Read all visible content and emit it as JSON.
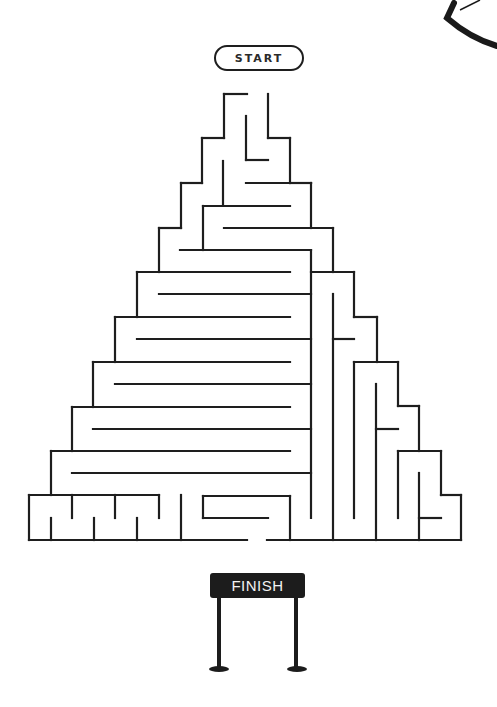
{
  "start": {
    "label": "START"
  },
  "finish": {
    "label": "FINISH",
    "sign_color": "#1c1c1c",
    "text_color": "#f2f2f2"
  },
  "maze": {
    "stroke": "#1e1e1e",
    "stroke_width": 2.2,
    "entrance": {
      "x1": 247,
      "x2": 268,
      "y": 94
    },
    "exit": {
      "x1": 247,
      "x2": 267,
      "y": 540
    },
    "walls": [
      [
        224,
        94,
        247,
        94
      ],
      [
        224,
        94,
        224,
        138
      ],
      [
        246,
        116,
        246,
        160
      ],
      [
        246,
        160,
        268,
        160
      ],
      [
        268,
        94,
        268,
        138
      ],
      [
        268,
        138,
        290,
        138
      ],
      [
        290,
        138,
        290,
        183
      ],
      [
        224,
        138,
        202,
        138
      ],
      [
        202,
        138,
        202,
        183
      ],
      [
        202,
        183,
        181,
        183
      ],
      [
        181,
        183,
        181,
        228
      ],
      [
        181,
        228,
        159,
        228
      ],
      [
        223,
        161,
        223,
        205
      ],
      [
        246,
        183,
        311,
        183
      ],
      [
        290,
        183,
        311,
        183
      ],
      [
        311,
        183,
        311,
        228
      ],
      [
        203,
        206,
        290,
        206
      ],
      [
        203,
        206,
        203,
        250
      ],
      [
        224,
        228,
        333,
        228
      ],
      [
        333,
        228,
        333,
        272
      ],
      [
        180,
        250,
        311,
        250
      ],
      [
        311,
        250,
        311,
        518
      ],
      [
        159,
        228,
        159,
        272
      ],
      [
        137,
        272,
        290,
        272
      ],
      [
        311,
        272,
        354,
        272
      ],
      [
        159,
        294,
        311,
        294
      ],
      [
        333,
        294,
        333,
        540
      ],
      [
        137,
        272,
        137,
        317
      ],
      [
        115,
        317,
        290,
        317
      ],
      [
        354,
        272,
        354,
        317
      ],
      [
        354,
        317,
        377,
        317
      ],
      [
        377,
        317,
        377,
        362
      ],
      [
        137,
        339,
        311,
        339
      ],
      [
        333,
        339,
        354,
        339
      ],
      [
        115,
        317,
        115,
        362
      ],
      [
        93,
        362,
        290,
        362
      ],
      [
        354,
        362,
        398,
        362
      ],
      [
        354,
        362,
        354,
        518
      ],
      [
        115,
        384,
        311,
        384
      ],
      [
        376,
        384,
        376,
        540
      ],
      [
        93,
        362,
        93,
        407
      ],
      [
        72,
        407,
        290,
        407
      ],
      [
        398,
        362,
        398,
        406
      ],
      [
        398,
        406,
        419,
        406
      ],
      [
        419,
        406,
        419,
        451
      ],
      [
        93,
        429,
        311,
        429
      ],
      [
        376,
        429,
        398,
        429
      ],
      [
        72,
        407,
        72,
        451
      ],
      [
        51,
        451,
        290,
        451
      ],
      [
        398,
        451,
        441,
        451
      ],
      [
        398,
        451,
        398,
        518
      ],
      [
        72,
        473,
        311,
        473
      ],
      [
        419,
        473,
        419,
        540
      ],
      [
        441,
        451,
        441,
        495
      ],
      [
        441,
        495,
        461,
        495
      ],
      [
        461,
        495,
        461,
        540
      ],
      [
        419,
        518,
        441,
        518
      ],
      [
        51,
        451,
        51,
        495
      ],
      [
        29,
        495,
        159,
        495
      ],
      [
        29,
        495,
        29,
        540
      ],
      [
        51,
        518,
        51,
        540
      ],
      [
        72,
        495,
        72,
        518
      ],
      [
        94,
        518,
        94,
        540
      ],
      [
        115,
        495,
        115,
        518
      ],
      [
        137,
        518,
        137,
        540
      ],
      [
        159,
        495,
        159,
        518
      ],
      [
        181,
        495,
        181,
        540
      ],
      [
        203,
        496,
        290,
        496
      ],
      [
        203,
        496,
        203,
        518
      ],
      [
        203,
        518,
        268,
        518
      ],
      [
        290,
        496,
        290,
        540
      ],
      [
        29,
        540,
        247,
        540
      ],
      [
        267,
        540,
        461,
        540
      ]
    ]
  },
  "finish_posts": {
    "left_x": 218,
    "right_x": 296,
    "top_y": 598,
    "bottom_y": 668
  }
}
